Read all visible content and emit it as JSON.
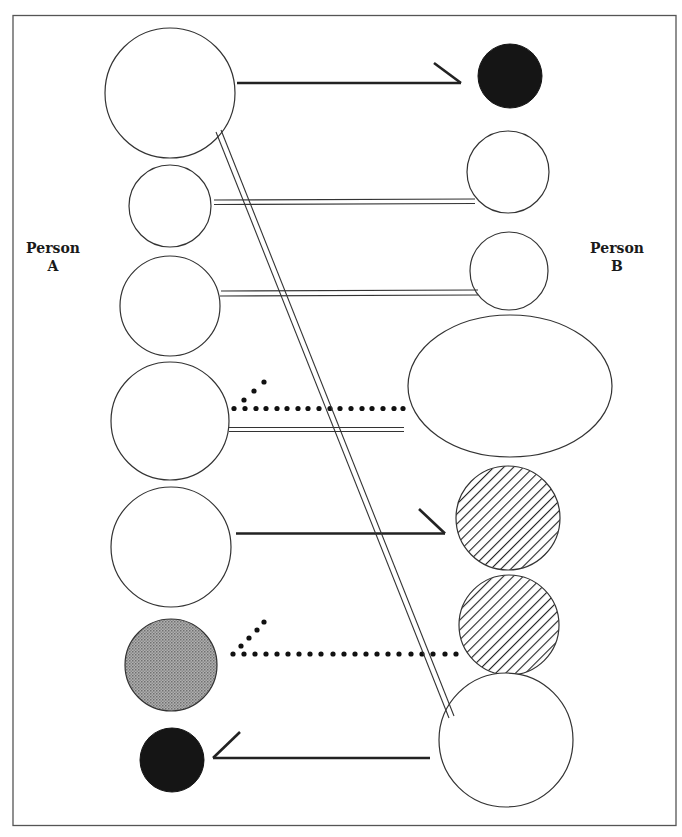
{
  "labels": {
    "person_a": [
      "Person",
      "A"
    ],
    "person_b": [
      "Person",
      "B"
    ]
  },
  "colors": {
    "frame": "#555555",
    "stroke": "#333333",
    "line": "#222222",
    "black_fill": "#151515",
    "gray_fill": "#9a9a9a",
    "hatch": "#222222",
    "background": "#ffffff"
  },
  "person_a_nodes": [
    {
      "id": "a1",
      "shape": "circle",
      "fill": "empty",
      "cx": 170,
      "cy": 93,
      "r": 65
    },
    {
      "id": "a2",
      "shape": "circle",
      "fill": "empty",
      "cx": 170,
      "cy": 206,
      "r": 41
    },
    {
      "id": "a3",
      "shape": "circle",
      "fill": "empty",
      "cx": 170,
      "cy": 306,
      "r": 50
    },
    {
      "id": "a4",
      "shape": "circle",
      "fill": "empty",
      "cx": 170,
      "cy": 421,
      "r": 59
    },
    {
      "id": "a5",
      "shape": "circle",
      "fill": "empty",
      "cx": 171,
      "cy": 547,
      "r": 60
    },
    {
      "id": "a6",
      "shape": "circle",
      "fill": "gray",
      "cx": 171,
      "cy": 665,
      "r": 46
    },
    {
      "id": "a7",
      "shape": "circle",
      "fill": "black",
      "cx": 172,
      "cy": 760,
      "r": 32
    }
  ],
  "person_b_nodes": [
    {
      "id": "b1",
      "shape": "circle",
      "fill": "black",
      "cx": 510,
      "cy": 76,
      "r": 32
    },
    {
      "id": "b2",
      "shape": "circle",
      "fill": "empty",
      "cx": 508,
      "cy": 172,
      "r": 41
    },
    {
      "id": "b3",
      "shape": "circle",
      "fill": "empty",
      "cx": 509,
      "cy": 271,
      "r": 39
    },
    {
      "id": "b4",
      "shape": "ellipse",
      "fill": "empty",
      "cx": 510,
      "cy": 386,
      "rx": 102,
      "ry": 71
    },
    {
      "id": "b5",
      "shape": "circle",
      "fill": "hatched",
      "cx": 508,
      "cy": 518,
      "r": 52
    },
    {
      "id": "b6",
      "shape": "circle",
      "fill": "hatched",
      "cx": 509,
      "cy": 625,
      "r": 50
    },
    {
      "id": "b7",
      "shape": "circle",
      "fill": "empty",
      "cx": 506,
      "cy": 740,
      "r": 67
    }
  ],
  "connections": [
    {
      "from": "a1",
      "to": "b1",
      "style": "solid-arrow",
      "x1": 237,
      "y1": 83,
      "x2": 460,
      "y2": 83,
      "head": [
        433,
        63
      ]
    },
    {
      "from": "a2",
      "to": "b2",
      "style": "double-line",
      "x1": 214,
      "y1": 203,
      "x2": 474,
      "y2": 203
    },
    {
      "from": "a3",
      "to": "b3",
      "style": "double-line",
      "x1": 221,
      "y1": 292,
      "x2": 477,
      "y2": 292
    },
    {
      "from": "a4",
      "to": "b4",
      "style": "dotted-arrow",
      "x1": 234,
      "y1": 408,
      "x2": 404,
      "y2": 408,
      "head_dots": [
        [
          244,
          399
        ],
        [
          254,
          391
        ],
        [
          264,
          382
        ]
      ]
    },
    {
      "from": "a4",
      "to": "b4",
      "style": "double-line",
      "x1": 229,
      "y1": 429,
      "x2": 404,
      "y2": 429
    },
    {
      "from": "a5",
      "to": "b5",
      "style": "solid-arrow",
      "x1": 236,
      "y1": 533,
      "x2": 444,
      "y2": 533,
      "head": [
        419,
        509
      ]
    },
    {
      "from": "a6",
      "to": "b6",
      "style": "dotted-arrow",
      "x1": 233,
      "y1": 654,
      "x2": 458,
      "y2": 654,
      "head_dots": [
        [
          241,
          646
        ],
        [
          248,
          638
        ],
        [
          256,
          630
        ],
        [
          264,
          622
        ]
      ]
    },
    {
      "from": "b7",
      "to": "a7",
      "style": "solid-arrow",
      "x1": 430,
      "y1": 758,
      "x2": 213,
      "y2": 758,
      "head": [
        240,
        732
      ]
    },
    {
      "from": "a1",
      "to": "b7",
      "style": "double-line-diagonal",
      "x1": 218,
      "y1": 131,
      "x2": 452,
      "y2": 717
    }
  ]
}
